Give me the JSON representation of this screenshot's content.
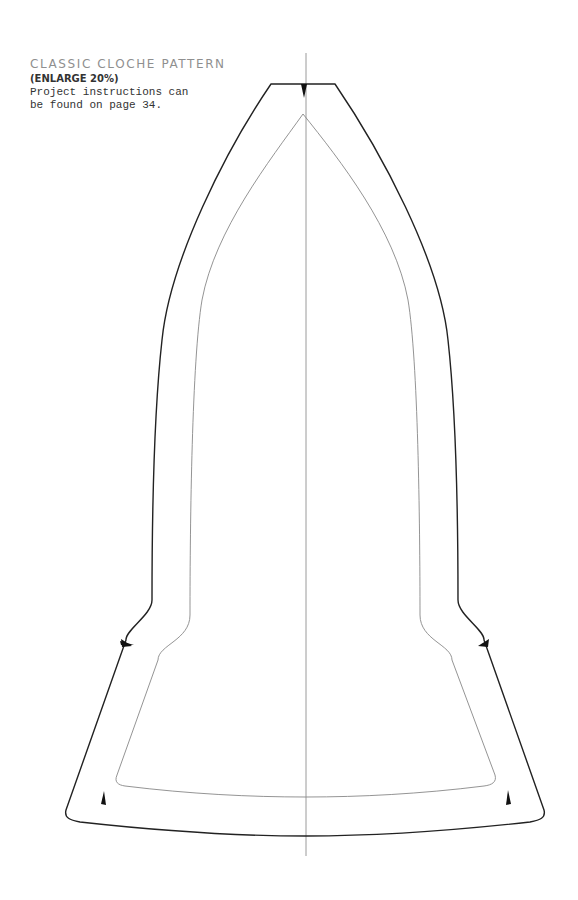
{
  "caption": {
    "title": "CLASSIC CLOCHE PATTERN",
    "subtitle": "(ENLARGE 20%)",
    "line1": "Project instructions can",
    "line2": "be found on page 34."
  },
  "pattern": {
    "name": "classic-cloche",
    "enlarge_percent": 20,
    "instructions_page": 34,
    "colors": {
      "cut_line": "#222222",
      "seam_line": "#888888",
      "center_line": "#999999"
    }
  }
}
